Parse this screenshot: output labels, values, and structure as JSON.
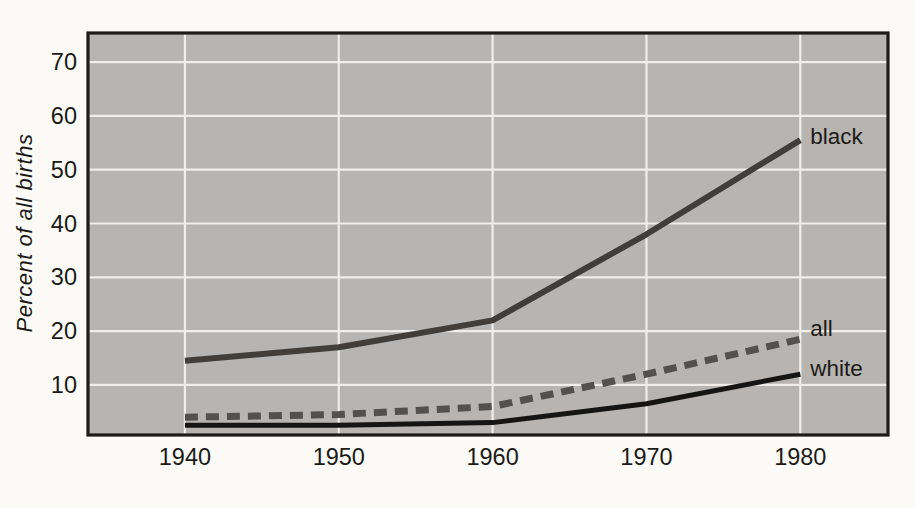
{
  "chart_data": {
    "type": "line",
    "title": "",
    "xlabel": "",
    "ylabel": "Percent of all births",
    "x": [
      1940,
      1950,
      1960,
      1970,
      1980
    ],
    "xticks": [
      "1940",
      "1950",
      "1960",
      "1970",
      "1980"
    ],
    "yticks": [
      10,
      20,
      30,
      40,
      50,
      60,
      70
    ],
    "xlim": [
      1933.7,
      1985.7
    ],
    "ylim": [
      0.7,
      75.4
    ],
    "grid": true,
    "legend_position": "inline-right-of-line-ends",
    "series": [
      {
        "name": "black",
        "label": "black",
        "values": [
          14.5,
          17,
          22,
          38,
          55.5
        ],
        "color": "#413e3a",
        "style": "solid",
        "width": 6
      },
      {
        "name": "all",
        "label": "all",
        "values": [
          4,
          4.5,
          6,
          12,
          18.5
        ],
        "color": "#53514d",
        "style": "dashed",
        "width": 7
      },
      {
        "name": "white",
        "label": "white",
        "values": [
          2.5,
          2.5,
          3,
          6.5,
          12
        ],
        "color": "#151513",
        "style": "solid",
        "width": 5
      }
    ],
    "colors": {
      "plot_background": "#b6b5b1",
      "gridline": "#efeeea",
      "frame": "#1d1c19",
      "tick_text": "#1b1a17",
      "page_background": "#fbfaf6"
    }
  }
}
